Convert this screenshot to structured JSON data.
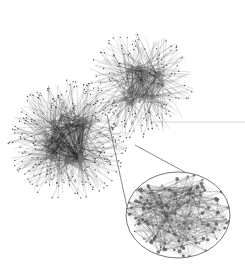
{
  "figure": {
    "type": "network-graph",
    "background": "#ffffff",
    "edge_color": "#222222",
    "node_color": "#555555",
    "clusters": [
      {
        "name": "cluster-upper-right",
        "cx": 140,
        "cy": 85,
        "r": 52,
        "density": 260,
        "hubs": 18
      },
      {
        "name": "cluster-lower-left",
        "cx": 68,
        "cy": 140,
        "r": 58,
        "density": 420,
        "hubs": 22
      }
    ],
    "magnifier": {
      "cx": 178,
      "cy": 215,
      "rx": 52,
      "ry": 43,
      "stroke": "#666666",
      "lines": [
        {
          "x1": 107,
          "y1": 115,
          "x2": 127,
          "y2": 207
        },
        {
          "x1": 135,
          "y1": 145,
          "x2": 192,
          "y2": 176
        }
      ],
      "density": 520
    },
    "stray_line": {
      "x1": 150,
      "y1": 122,
      "x2": 245,
      "y2": 122
    }
  }
}
